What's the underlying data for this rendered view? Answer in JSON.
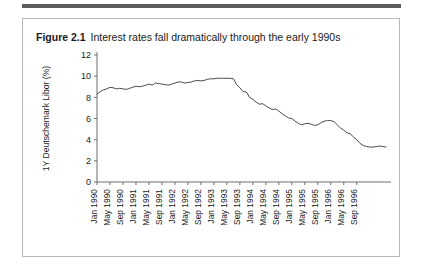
{
  "figure": {
    "number": "Figure 2.1",
    "title": "Interest rates fall dramatically through the early 1990s"
  },
  "chart_data": {
    "type": "line",
    "title": "Interest rates fall dramatically through the early 1990s",
    "xlabel": "",
    "ylabel": "1Y Deutschemark Libor (%)",
    "ylim": [
      0,
      12
    ],
    "yticks": [
      0,
      2,
      4,
      6,
      8,
      10,
      12
    ],
    "ytick_labels": [
      "0",
      "2",
      "4",
      "6",
      "8",
      "10",
      "12"
    ],
    "grid": false,
    "legend": false,
    "line_color": "#4a4a4a",
    "xtick_labels": [
      "Jan 1990",
      "May 1990",
      "Sep 1990",
      "Jan 1991",
      "May 1991",
      "Sep 1991",
      "Jan 1992",
      "May 1992",
      "Sep 1992",
      "Jan 1993",
      "May 1993",
      "Sep 1993",
      "Jan 1994",
      "May 1994",
      "Sep 1994",
      "Jan 1995",
      "May 1995",
      "Sep 1995",
      "Jan 1996",
      "May 1996",
      "Sep 1996"
    ],
    "x": [
      "Jan 1990",
      "Feb 1990",
      "Mar 1990",
      "Apr 1990",
      "May 1990",
      "Jun 1990",
      "Jul 1990",
      "Aug 1990",
      "Sep 1990",
      "Oct 1990",
      "Nov 1990",
      "Dec 1990",
      "Jan 1991",
      "Feb 1991",
      "Mar 1991",
      "Apr 1991",
      "May 1991",
      "Jun 1991",
      "Jul 1991",
      "Aug 1991",
      "Sep 1991",
      "Oct 1991",
      "Nov 1991",
      "Dec 1991",
      "Jan 1992",
      "Feb 1992",
      "Mar 1992",
      "Apr 1992",
      "May 1992",
      "Jun 1992",
      "Jul 1992",
      "Aug 1992",
      "Sep 1992",
      "Oct 1992",
      "Nov 1992",
      "Dec 1992",
      "Jan 1993",
      "Feb 1993",
      "Mar 1993",
      "Apr 1993",
      "May 1993",
      "Jun 1993",
      "Jul 1993",
      "Aug 1993",
      "Sep 1993",
      "Oct 1993",
      "Nov 1993",
      "Dec 1993",
      "Jan 1994",
      "Feb 1994",
      "Mar 1994",
      "Apr 1994",
      "May 1994",
      "Jun 1994",
      "Jul 1994",
      "Aug 1994",
      "Sep 1994",
      "Oct 1994",
      "Nov 1994",
      "Dec 1994",
      "Jan 1995",
      "Feb 1995",
      "Mar 1995",
      "Apr 1995",
      "May 1995",
      "Jun 1995",
      "Jul 1995",
      "Aug 1995",
      "Sep 1995",
      "Oct 1995",
      "Nov 1995",
      "Dec 1995",
      "Jan 1996",
      "Feb 1996",
      "Mar 1996",
      "Apr 1996",
      "May 1996",
      "Jun 1996",
      "Jul 1996",
      "Aug 1996",
      "Sep 1996"
    ],
    "y": [
      8.3,
      8.55,
      8.7,
      8.8,
      8.95,
      8.9,
      8.8,
      8.85,
      8.8,
      8.75,
      8.85,
      8.95,
      9.05,
      9.0,
      9.05,
      9.15,
      9.25,
      9.15,
      9.35,
      9.3,
      9.25,
      9.2,
      9.15,
      9.25,
      9.35,
      9.45,
      9.45,
      9.35,
      9.4,
      9.45,
      9.55,
      9.6,
      9.55,
      9.6,
      9.7,
      9.75,
      9.75,
      9.8,
      9.8,
      9.8,
      9.8,
      9.8,
      9.75,
      9.2,
      8.9,
      8.55,
      8.5,
      8.0,
      7.8,
      7.55,
      7.35,
      7.4,
      7.2,
      7.0,
      6.85,
      6.9,
      6.7,
      6.45,
      6.25,
      6.05,
      6.0,
      5.75,
      5.55,
      5.4,
      5.5,
      5.55,
      5.45,
      5.35,
      5.4,
      5.6,
      5.75,
      5.8,
      5.8,
      5.7,
      5.4,
      5.1,
      4.9,
      4.65,
      4.55,
      4.25,
      4.0,
      3.65,
      3.45,
      3.35,
      3.3,
      3.3,
      3.35,
      3.4,
      3.35,
      3.3
    ]
  }
}
